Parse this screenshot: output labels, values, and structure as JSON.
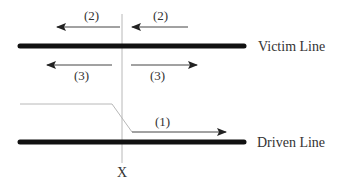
{
  "diagram": {
    "lines": {
      "victim": {
        "label": "Victim Line",
        "y": 46,
        "x1": 18,
        "x2": 245
      },
      "driven": {
        "label": "Driven Line",
        "y": 142,
        "x1": 18,
        "x2": 245
      }
    },
    "cut_marker": {
      "label": "X",
      "x": 122
    },
    "signals": {
      "driven_signal": {
        "label": "(1)"
      },
      "backward_crosstalk_left": {
        "label": "(2)"
      },
      "backward_crosstalk_right": {
        "label": "(2)"
      },
      "near_far_left": {
        "label": "(3)"
      },
      "near_far_right": {
        "label": "(3)"
      }
    },
    "colors": {
      "thick_line": "#111111",
      "arrow": "#222222",
      "thin_grey": "#b8b8b8",
      "text": "#333333"
    }
  }
}
